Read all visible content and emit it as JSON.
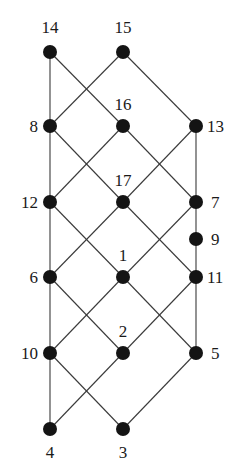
{
  "diagram": {
    "type": "hasse-diagram",
    "node_radius": 7,
    "colors": {
      "node": "#141414",
      "edge": "#3a3a3a",
      "label": "#1a1a1a",
      "background": "#ffffff"
    },
    "nodes": [
      {
        "id": "14",
        "x": 50,
        "y": 52,
        "label": "14",
        "lx": 50,
        "ly": 33,
        "anchor": "middle"
      },
      {
        "id": "15",
        "x": 123,
        "y": 52,
        "label": "15",
        "lx": 123,
        "ly": 33,
        "anchor": "middle"
      },
      {
        "id": "8",
        "x": 50,
        "y": 126,
        "label": "8",
        "lx": 38,
        "ly": 132,
        "anchor": "end"
      },
      {
        "id": "16",
        "x": 123,
        "y": 126,
        "label": "16",
        "lx": 123,
        "ly": 110,
        "anchor": "middle"
      },
      {
        "id": "13",
        "x": 196,
        "y": 126,
        "label": "13",
        "lx": 207,
        "ly": 132,
        "anchor": "start"
      },
      {
        "id": "12",
        "x": 50,
        "y": 202,
        "label": "12",
        "lx": 38,
        "ly": 208,
        "anchor": "end"
      },
      {
        "id": "17",
        "x": 123,
        "y": 202,
        "label": "17",
        "lx": 123,
        "ly": 186,
        "anchor": "middle"
      },
      {
        "id": "7",
        "x": 196,
        "y": 202,
        "label": "7",
        "lx": 211,
        "ly": 208,
        "anchor": "start"
      },
      {
        "id": "9",
        "x": 196,
        "y": 239,
        "label": "9",
        "lx": 211,
        "ly": 245,
        "anchor": "start"
      },
      {
        "id": "6",
        "x": 50,
        "y": 277,
        "label": "6",
        "lx": 38,
        "ly": 283,
        "anchor": "end"
      },
      {
        "id": "1",
        "x": 123,
        "y": 277,
        "label": "1",
        "lx": 123,
        "ly": 261,
        "anchor": "middle"
      },
      {
        "id": "11",
        "x": 196,
        "y": 277,
        "label": "11",
        "lx": 207,
        "ly": 283,
        "anchor": "start"
      },
      {
        "id": "10",
        "x": 50,
        "y": 353,
        "label": "10",
        "lx": 38,
        "ly": 359,
        "anchor": "end"
      },
      {
        "id": "2",
        "x": 123,
        "y": 353,
        "label": "2",
        "lx": 123,
        "ly": 337,
        "anchor": "middle"
      },
      {
        "id": "5",
        "x": 196,
        "y": 353,
        "label": "5",
        "lx": 211,
        "ly": 359,
        "anchor": "start"
      },
      {
        "id": "4",
        "x": 50,
        "y": 429,
        "label": "4",
        "lx": 50,
        "ly": 458,
        "anchor": "middle"
      },
      {
        "id": "3",
        "x": 123,
        "y": 429,
        "label": "3",
        "lx": 123,
        "ly": 458,
        "anchor": "middle"
      }
    ],
    "edges": [
      [
        "14",
        "8"
      ],
      [
        "14",
        "16"
      ],
      [
        "15",
        "8"
      ],
      [
        "15",
        "13"
      ],
      [
        "8",
        "12"
      ],
      [
        "8",
        "17"
      ],
      [
        "16",
        "12"
      ],
      [
        "16",
        "7"
      ],
      [
        "13",
        "17"
      ],
      [
        "13",
        "7"
      ],
      [
        "12",
        "6"
      ],
      [
        "12",
        "1"
      ],
      [
        "17",
        "6"
      ],
      [
        "17",
        "11"
      ],
      [
        "7",
        "1"
      ],
      [
        "7",
        "9"
      ],
      [
        "9",
        "11"
      ],
      [
        "6",
        "10"
      ],
      [
        "6",
        "2"
      ],
      [
        "1",
        "10"
      ],
      [
        "1",
        "5"
      ],
      [
        "11",
        "2"
      ],
      [
        "11",
        "5"
      ],
      [
        "10",
        "4"
      ],
      [
        "10",
        "3"
      ],
      [
        "2",
        "4"
      ],
      [
        "5",
        "3"
      ]
    ]
  }
}
